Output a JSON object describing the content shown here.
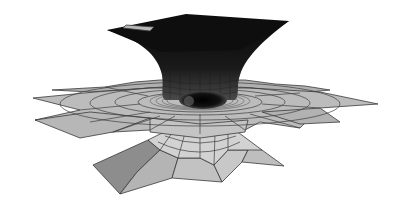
{
  "figure": {
    "title": "",
    "colors": {
      "background": "#ffffff",
      "top_surface": "#0d0d0d",
      "skirt_light": "#bdbdbd",
      "skirt_mid": "#a8a8a8",
      "cone_dark": "#8c8c8c",
      "mesh_line": "#3a3a3a",
      "hole": "#050505"
    },
    "parts": [
      {
        "name": "top-plate",
        "shade": "dark"
      },
      {
        "name": "funnel-throat",
        "shade": "dark"
      },
      {
        "name": "middle-skirt",
        "shade": "light-gray"
      },
      {
        "name": "central-hole",
        "shade": "black"
      },
      {
        "name": "lower-cone",
        "shade": "gray"
      }
    ]
  }
}
